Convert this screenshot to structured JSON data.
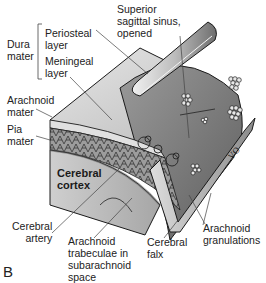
{
  "figure": {
    "panel_letter": "B"
  },
  "labels": {
    "dura_mater": "Dura\nmater",
    "periosteal_layer": "Periosteal\nlayer",
    "meningeal_layer": "Meningeal\nlayer",
    "superior_sagittal_sinus": "Superior\nsagittal sinus,\nopened",
    "arachnoid_mater": "Arachnoid\nmater",
    "pia_mater": "Pia\nmater",
    "cerebral_cortex": "Cerebral\ncortex",
    "cerebral_artery": "Cerebral\nartery",
    "arachnoid_trabeculae": "Arachnoid\ntrabeculae in\nsubarachnoid\nspace",
    "cerebral_falx": "Cerebral\nfalx",
    "arachnoid_granulations": "Arachnoid\ngranulations"
  },
  "colors": {
    "outline": "#1a1a1a",
    "dura_light": "#d4d4d4",
    "dura_mid": "#a8a8a8",
    "sinus_dark": "#7a7a7a",
    "cortex": "#c8c8c8",
    "leader_line": "#444444"
  }
}
